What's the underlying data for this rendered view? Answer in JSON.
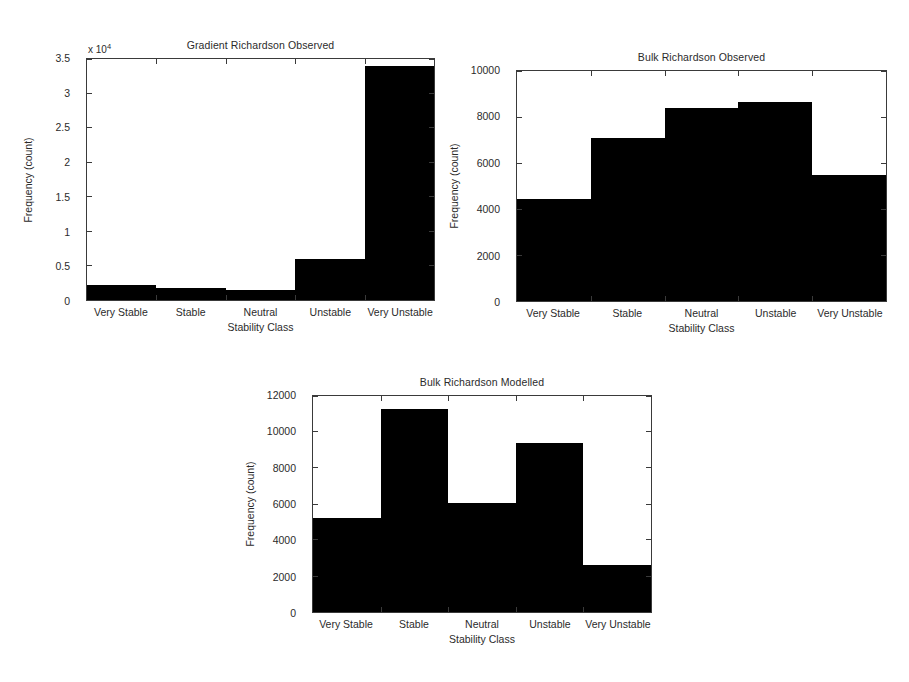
{
  "figure": {
    "background": "#ffffff",
    "bar_color": "#000000",
    "axis_color": "#3a3a3a"
  },
  "charts": [
    {
      "id": "gradient-observed",
      "title": "Gradient Richardson Observed",
      "xlabel": "Stability Class",
      "ylabel": "Frequency (count)",
      "exponent_label": "x 10",
      "exponent_power": "4",
      "ytick_labels": [
        "0",
        "0.5",
        "1",
        "1.5",
        "2",
        "2.5",
        "3",
        "3.5"
      ],
      "xtick_labels": [
        "Very Stable",
        "Stable",
        "Neutral",
        "Unstable",
        "Very Unstable"
      ]
    },
    {
      "id": "bulk-observed",
      "title": "Bulk Richardson Observed",
      "xlabel": "Stability Class",
      "ylabel": "Frequency (count)",
      "exponent_label": "",
      "exponent_power": "",
      "ytick_labels": [
        "0",
        "2000",
        "4000",
        "6000",
        "8000",
        "10000"
      ],
      "xtick_labels": [
        "Very Stable",
        "Stable",
        "Neutral",
        "Unstable",
        "Very Unstable"
      ]
    },
    {
      "id": "bulk-modelled",
      "title": "Bulk Richardson Modelled",
      "xlabel": "Stability Class",
      "ylabel": "Frequency (count)",
      "exponent_label": "",
      "exponent_power": "",
      "ytick_labels": [
        "0",
        "2000",
        "4000",
        "6000",
        "8000",
        "10000",
        "12000"
      ],
      "xtick_labels": [
        "Very Stable",
        "Stable",
        "Neutral",
        "Unstable",
        "Very Unstable"
      ]
    }
  ],
  "chart_data": [
    {
      "type": "bar",
      "id": "gradient-observed",
      "title": "Gradient Richardson Observed",
      "xlabel": "Stability Class",
      "ylabel": "Frequency (count)",
      "categories": [
        "Very Stable",
        "Stable",
        "Neutral",
        "Unstable",
        "Very Unstable"
      ],
      "values": [
        2200,
        1700,
        1500,
        6000,
        34000
      ],
      "ylim": [
        0,
        35000
      ],
      "yticks": [
        0,
        5000,
        10000,
        15000,
        20000,
        25000,
        30000,
        35000
      ],
      "ytick_labels": [
        "0",
        "0.5",
        "1",
        "1.5",
        "2",
        "2.5",
        "3",
        "3.5"
      ],
      "y_exponent": 10000,
      "y_exponent_label": "x 10^4",
      "grid": false,
      "legend": null
    },
    {
      "type": "bar",
      "id": "bulk-observed",
      "title": "Bulk Richardson Observed",
      "xlabel": "Stability Class",
      "ylabel": "Frequency (count)",
      "categories": [
        "Very Stable",
        "Stable",
        "Neutral",
        "Unstable",
        "Very Unstable"
      ],
      "values": [
        4450,
        7100,
        8400,
        8650,
        5500
      ],
      "ylim": [
        0,
        10000
      ],
      "yticks": [
        0,
        2000,
        4000,
        6000,
        8000,
        10000
      ],
      "ytick_labels": [
        "0",
        "2000",
        "4000",
        "6000",
        "8000",
        "10000"
      ],
      "grid": false,
      "legend": null
    },
    {
      "type": "bar",
      "id": "bulk-modelled",
      "title": "Bulk Richardson Modelled",
      "xlabel": "Stability Class",
      "ylabel": "Frequency (count)",
      "categories": [
        "Very Stable",
        "Stable",
        "Neutral",
        "Unstable",
        "Very Unstable"
      ],
      "values": [
        5200,
        11300,
        6050,
        9400,
        2600
      ],
      "ylim": [
        0,
        12000
      ],
      "yticks": [
        0,
        2000,
        4000,
        6000,
        8000,
        10000,
        12000
      ],
      "ytick_labels": [
        "0",
        "2000",
        "4000",
        "6000",
        "8000",
        "10000",
        "12000"
      ],
      "grid": false,
      "legend": null
    }
  ]
}
